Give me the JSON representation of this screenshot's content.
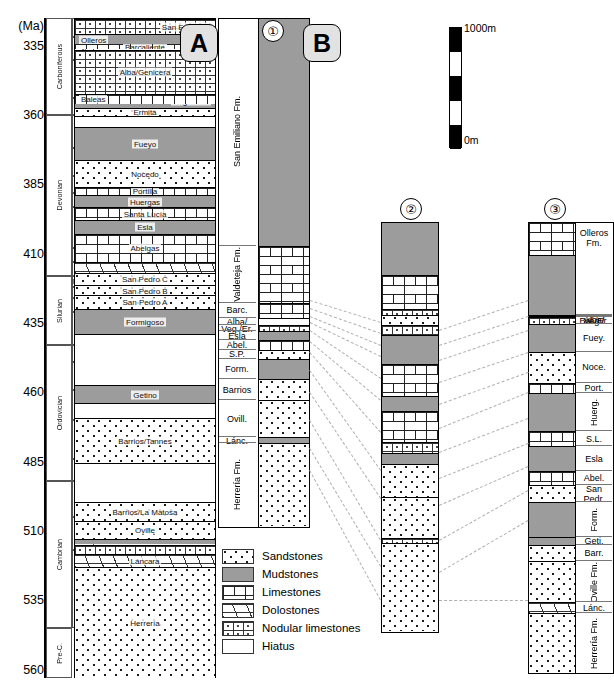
{
  "figure": {
    "unit_axis_label": "(Ma)",
    "panel_tags": [
      "A",
      "B"
    ],
    "column_numbers": [
      "①",
      "②",
      "③"
    ]
  },
  "time_axis": {
    "label": "(Ma)",
    "ticks": [
      335,
      360,
      385,
      410,
      435,
      460,
      485,
      510,
      535,
      560
    ],
    "range": [
      325,
      563
    ]
  },
  "periods": [
    {
      "name": "Carboniferous",
      "top": 325,
      "base": 360
    },
    {
      "name": "Devonian",
      "top": 360,
      "base": 418
    },
    {
      "name": "Silurian",
      "top": 418,
      "base": 443
    },
    {
      "name": "Ordovician",
      "top": 443,
      "base": 492
    },
    {
      "name": "Cambrian",
      "top": 492,
      "base": 545
    },
    {
      "name": "Pre-C.",
      "top": 545,
      "base": 563
    }
  ],
  "stages": [
    {
      "name": "Bash.",
      "top": 325,
      "base": 332
    },
    {
      "name": "Serp.",
      "top": 332,
      "base": 340
    },
    {
      "name": "Visean",
      "top": 340,
      "base": 354
    },
    {
      "name": "Tournais.",
      "top": 354,
      "base": 360
    },
    {
      "name": "Famenn.",
      "top": 360,
      "base": 372
    },
    {
      "name": "Frasn.",
      "top": 372,
      "base": 382
    },
    {
      "name": "Giv.",
      "top": 382,
      "base": 388
    },
    {
      "name": "Eifel.",
      "top": 388,
      "base": 393
    },
    {
      "name": "Emsian",
      "top": 393,
      "base": 408
    },
    {
      "name": "Prag.",
      "top": 408,
      "base": 413
    },
    {
      "name": "Loch.",
      "top": 413,
      "base": 418
    },
    {
      "name": "Pridol.",
      "top": 418,
      "base": 422
    },
    {
      "name": "Ludl.",
      "top": 422,
      "base": 426
    },
    {
      "name": "Wen.",
      "top": 426,
      "base": 431
    },
    {
      "name": "Llandover.",
      "top": 431,
      "base": 443
    },
    {
      "name": "Ash.",
      "top": 443,
      "base": 449
    },
    {
      "name": "Carad.",
      "top": 449,
      "base": 459
    },
    {
      "name": "Llanvirn",
      "top": 459,
      "base": 470
    },
    {
      "name": "Arenig",
      "top": 470,
      "base": 484
    },
    {
      "name": "Trem.",
      "top": 484,
      "base": 492
    },
    {
      "name": "Late",
      "top": 492,
      "base": 505
    },
    {
      "name": "Middle",
      "top": 505,
      "base": 517
    },
    {
      "name": "Early",
      "top": 517,
      "base": 545
    }
  ],
  "column_A": {
    "title": "A",
    "units": [
      {
        "name": "San Emiliano",
        "lith": "nodular",
        "top": 325,
        "base": 330.5,
        "label_pos": "right"
      },
      {
        "name": "Valdeteja",
        "lith": "limestone",
        "top": 330.5,
        "base": 333.5,
        "label_pos": "right"
      },
      {
        "name": "Barcaliente",
        "lith": "limestone",
        "top": 333.5,
        "base": 336.0,
        "label_pos": "center"
      },
      {
        "name": "Olleros",
        "lith": "mudstone",
        "top": 330.5,
        "base": 334.0,
        "label_pos": "left"
      },
      {
        "name": "Alba/Genicera",
        "lith": "nodular",
        "top": 336.0,
        "base": 352.0,
        "label_pos": "center"
      },
      {
        "name": "Vegamián",
        "lith": "mudstone",
        "top": 352.0,
        "base": 357.0,
        "label_pos": "right"
      },
      {
        "name": "Baleas",
        "lith": "limestone",
        "top": 352.0,
        "base": 355.5,
        "label_pos": "left"
      },
      {
        "name": "Ermita",
        "lith": "sandstone",
        "top": 357.0,
        "base": 360.0,
        "label_pos": "center"
      },
      {
        "name": "Hiatus",
        "lith": "hiatus",
        "top": 360.0,
        "base": 364.0,
        "label_pos": "none"
      },
      {
        "name": "Fueyo",
        "lith": "mudstone",
        "top": 364.0,
        "base": 376.0,
        "label_pos": "center"
      },
      {
        "name": "Nocedo",
        "lith": "sandstone",
        "top": 376.0,
        "base": 385.5,
        "label_pos": "center"
      },
      {
        "name": "Portilla",
        "lith": "limestone",
        "top": 385.5,
        "base": 388.5,
        "label_pos": "center"
      },
      {
        "name": "Huergas",
        "lith": "mudstone",
        "top": 388.5,
        "base": 392.8,
        "label_pos": "center"
      },
      {
        "name": "Santa Lucía",
        "lith": "limestone",
        "top": 392.8,
        "base": 397.5,
        "label_pos": "center"
      },
      {
        "name": "Esla",
        "lith": "mudstone",
        "top": 397.5,
        "base": 402.5,
        "label_pos": "center"
      },
      {
        "name": "Abelgas",
        "lith": "limestone",
        "top": 402.5,
        "base": 412.5,
        "label_pos": "center"
      },
      {
        "name": "",
        "lith": "dolostone",
        "top": 412.5,
        "base": 416.5,
        "label_pos": "none"
      },
      {
        "name": "San Pedro C",
        "lith": "sandstone",
        "top": 416.5,
        "base": 421.0,
        "label_pos": "center"
      },
      {
        "name": "San Pedro B",
        "lith": "sandstone",
        "top": 421.0,
        "base": 424.5,
        "label_pos": "center"
      },
      {
        "name": "San Pedro A",
        "lith": "sandstone",
        "top": 424.5,
        "base": 429.5,
        "label_pos": "center"
      },
      {
        "name": "Formigoso",
        "lith": "mudstone",
        "top": 429.5,
        "base": 438.5,
        "label_pos": "center"
      },
      {
        "name": "Hiatus",
        "lith": "hiatus",
        "top": 438.5,
        "base": 457.0,
        "label_pos": "none"
      },
      {
        "name": "Getino",
        "lith": "mudstone",
        "top": 457.0,
        "base": 463.5,
        "label_pos": "center"
      },
      {
        "name": "Hiatus",
        "lith": "hiatus",
        "top": 463.5,
        "base": 469.0,
        "label_pos": "none"
      },
      {
        "name": "Barrios/Tannes",
        "lith": "sandstone",
        "top": 469.0,
        "base": 485.0,
        "label_pos": "center"
      },
      {
        "name": "Hiatus",
        "lith": "hiatus",
        "top": 485.0,
        "base": 499.0,
        "label_pos": "none"
      },
      {
        "name": "Barrios/La Matosa",
        "lith": "sandstone",
        "top": 499.0,
        "base": 506.0,
        "label_pos": "center"
      },
      {
        "name": "Oville",
        "lith": "sandstone",
        "top": 506.0,
        "base": 512.5,
        "label_pos": "center"
      },
      {
        "name": "",
        "lith": "mudstone",
        "top": 512.5,
        "base": 514.5,
        "label_pos": "none"
      },
      {
        "name": "",
        "lith": "nodular",
        "top": 514.5,
        "base": 518.0,
        "label_pos": "none"
      },
      {
        "name": "Láncara",
        "lith": "dolostone",
        "top": 518.0,
        "base": 522.5,
        "label_pos": "center"
      },
      {
        "name": "Herrería",
        "lith": "sandstone",
        "top": 522.5,
        "base": 563.0,
        "label_pos": "center"
      }
    ]
  },
  "column_B": {
    "title": "B",
    "number": "①",
    "units": [
      {
        "name": "San Emiliano Fm.",
        "lith": "mudstone",
        "thickness": 293
      },
      {
        "name": "Valdeteja Fm.",
        "lith": "limestone",
        "thickness": 73
      },
      {
        "name": "Barc.",
        "lith": "limestone",
        "thickness": 19
      },
      {
        "name": "Alba/",
        "lith": "hiatus",
        "thickness": 9
      },
      {
        "name": "Veg./Er.",
        "lith": "nodular",
        "thickness": 8
      },
      {
        "name": "Esla",
        "lith": "mudstone",
        "thickness": 12
      },
      {
        "name": "Abel.",
        "lith": "limestone",
        "thickness": 12
      },
      {
        "name": "S.P.",
        "lith": "sandstone",
        "thickness": 12
      },
      {
        "name": "Form.",
        "lith": "mudstone",
        "thickness": 26
      },
      {
        "name": "Barrios",
        "lith": "sandstone",
        "thickness": 27
      },
      {
        "name": "Ovill.",
        "lith": "sandstone",
        "thickness": 48
      },
      {
        "name": "Lánc.",
        "lith": "mudstone",
        "thickness": 7
      },
      {
        "name": "Herrería Fm.",
        "lith": "sandstone",
        "thickness": 107
      }
    ]
  },
  "column_2": {
    "number": "②",
    "units": [
      {
        "lith": "mudstone",
        "thickness": 57
      },
      {
        "lith": "limestone",
        "thickness": 37
      },
      {
        "lith": "nodular",
        "thickness": 7
      },
      {
        "lith": "sandstone",
        "thickness": 11
      },
      {
        "lith": "nodular",
        "thickness": 10
      },
      {
        "lith": "mudstone",
        "thickness": 32
      },
      {
        "lith": "limestone",
        "thickness": 35
      },
      {
        "lith": "mudstone",
        "thickness": 17
      },
      {
        "lith": "limestone",
        "thickness": 33
      },
      {
        "lith": "nodular",
        "thickness": 13
      },
      {
        "lith": "mudstone",
        "thickness": 12
      },
      {
        "lith": "sandstone",
        "thickness": 36
      },
      {
        "lith": "sandstone",
        "thickness": 44
      },
      {
        "lith": "nodular",
        "thickness": 6
      },
      {
        "lith": "sandstone",
        "thickness": 96
      }
    ]
  },
  "column_3": {
    "number": "③",
    "units": [
      {
        "name": "Olleros Fm.",
        "lith": "limestone",
        "thickness": 40,
        "label_side": true
      },
      {
        "name": "",
        "lith": "mudstone",
        "thickness": 77,
        "label_side": false
      },
      {
        "name": "Alba/",
        "lith": "hiatus",
        "thickness": 0,
        "label_side": true
      },
      {
        "name": "Veg./",
        "lith": "hiatus",
        "thickness": 0,
        "label_side": true
      },
      {
        "name": "Bal./Er.",
        "lith": "nodular",
        "thickness": 9,
        "label_side": true
      },
      {
        "name": "Fuey.",
        "lith": "mudstone",
        "thickness": 35,
        "label_side": true
      },
      {
        "name": "Noce.",
        "lith": "sandstone",
        "thickness": 40,
        "label_side": true
      },
      {
        "name": "Port.",
        "lith": "limestone",
        "thickness": 13,
        "label_side": true
      },
      {
        "name": "Huerg.",
        "lith": "mudstone",
        "thickness": 48,
        "label_side": true
      },
      {
        "name": "S.L.",
        "lith": "limestone",
        "thickness": 19,
        "label_side": true
      },
      {
        "name": "Esla",
        "lith": "mudstone",
        "thickness": 32,
        "label_side": true
      },
      {
        "name": "Abel.",
        "lith": "limestone",
        "thickness": 17,
        "label_side": true
      },
      {
        "name": "San Pedr.",
        "lith": "sandstone",
        "thickness": 22,
        "label_side": true
      },
      {
        "name": "Form.",
        "lith": "mudstone",
        "thickness": 44,
        "label_side": true
      },
      {
        "name": "Geti.",
        "lith": "mudstone",
        "thickness": 10,
        "label_side": true
      },
      {
        "name": "Barr.",
        "lith": "sandstone",
        "thickness": 21,
        "label_side": true
      },
      {
        "name": "Oville Fm.",
        "lith": "sandstone",
        "thickness": 52,
        "label_side": true
      },
      {
        "name": "Lánc.",
        "lith": "dolostone",
        "thickness": 14,
        "label_side": true
      },
      {
        "name": "Herrería Fm.",
        "lith": "sandstone",
        "thickness": 76,
        "label_side": true
      }
    ]
  },
  "scale": {
    "top_label": "1000m",
    "bottom_label": "0m",
    "segments": 5
  },
  "legend": {
    "items": [
      {
        "label": "Sandstones",
        "lith": "sandstone"
      },
      {
        "label": "Mudstones",
        "lith": "mudstone"
      },
      {
        "label": "Limestones",
        "lith": "limestone"
      },
      {
        "label": "Dolostones",
        "lith": "dolostone"
      },
      {
        "label": "Nodular limestones",
        "lith": "nodular"
      },
      {
        "label": "Hiatus",
        "lith": "hiatus"
      }
    ]
  },
  "colors": {
    "mudstone": "#9c9c9c",
    "background": "#ffffff",
    "line": "#000000",
    "correlation": "#b0b0b0",
    "tag_fill": "#e2e2e2"
  }
}
